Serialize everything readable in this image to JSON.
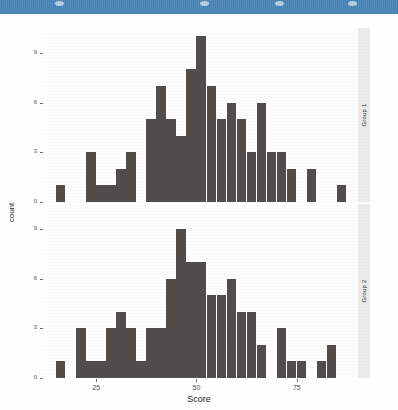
{
  "window": {
    "titlebar_color": "#4a86b8",
    "dots": [
      {
        "name": "chrome-dot-1",
        "x": 55
      },
      {
        "name": "chrome-dot-2",
        "x": 200
      },
      {
        "name": "chrome-dot-3",
        "x": 275
      },
      {
        "name": "chrome-dot-4",
        "x": 348
      }
    ]
  },
  "chart_data": {
    "type": "bar",
    "title": "",
    "subtitle": "",
    "xlabel": "Score",
    "ylabel": "count",
    "xlim": [
      12,
      90
    ],
    "ylim": [
      0,
      10.5
    ],
    "xticks": [
      25,
      50,
      75
    ],
    "yticks": [
      0,
      3,
      6,
      9
    ],
    "grid": false,
    "legend_position": "none",
    "bar_color": "#514d4a",
    "panel_background": "#fdfdfd",
    "strip_background": "#ebebeb",
    "facet_variable": "Group",
    "binwidth": 2.5,
    "panels": [
      {
        "strip_label": "Group 1",
        "bins": [
          {
            "x": 16.25,
            "count": 1
          },
          {
            "x": 18.75,
            "count": 0
          },
          {
            "x": 21.25,
            "count": 0
          },
          {
            "x": 23.75,
            "count": 3
          },
          {
            "x": 26.25,
            "count": 1
          },
          {
            "x": 28.75,
            "count": 1
          },
          {
            "x": 31.25,
            "count": 2
          },
          {
            "x": 33.75,
            "count": 3
          },
          {
            "x": 36.25,
            "count": 0
          },
          {
            "x": 38.75,
            "count": 5
          },
          {
            "x": 41.25,
            "count": 7
          },
          {
            "x": 43.75,
            "count": 5
          },
          {
            "x": 46.25,
            "count": 4
          },
          {
            "x": 48.75,
            "count": 8
          },
          {
            "x": 51.25,
            "count": 10
          },
          {
            "x": 53.75,
            "count": 7
          },
          {
            "x": 56.25,
            "count": 5
          },
          {
            "x": 58.75,
            "count": 6
          },
          {
            "x": 61.25,
            "count": 5
          },
          {
            "x": 63.75,
            "count": 3
          },
          {
            "x": 66.25,
            "count": 6
          },
          {
            "x": 68.75,
            "count": 3
          },
          {
            "x": 71.25,
            "count": 3
          },
          {
            "x": 73.75,
            "count": 2
          },
          {
            "x": 76.25,
            "count": 0
          },
          {
            "x": 78.75,
            "count": 2
          },
          {
            "x": 81.25,
            "count": 0
          },
          {
            "x": 83.75,
            "count": 0
          },
          {
            "x": 86.25,
            "count": 1
          }
        ]
      },
      {
        "strip_label": "Group 2",
        "bins": [
          {
            "x": 16.25,
            "count": 1
          },
          {
            "x": 18.75,
            "count": 0
          },
          {
            "x": 21.25,
            "count": 3
          },
          {
            "x": 23.75,
            "count": 1
          },
          {
            "x": 26.25,
            "count": 1
          },
          {
            "x": 28.75,
            "count": 3
          },
          {
            "x": 31.25,
            "count": 4
          },
          {
            "x": 33.75,
            "count": 3
          },
          {
            "x": 36.25,
            "count": 1
          },
          {
            "x": 38.75,
            "count": 3
          },
          {
            "x": 41.25,
            "count": 3
          },
          {
            "x": 43.75,
            "count": 6
          },
          {
            "x": 46.25,
            "count": 9
          },
          {
            "x": 48.75,
            "count": 7
          },
          {
            "x": 51.25,
            "count": 7
          },
          {
            "x": 53.75,
            "count": 5
          },
          {
            "x": 56.25,
            "count": 5
          },
          {
            "x": 58.75,
            "count": 6
          },
          {
            "x": 61.25,
            "count": 4
          },
          {
            "x": 63.75,
            "count": 4
          },
          {
            "x": 66.25,
            "count": 2
          },
          {
            "x": 68.75,
            "count": 0
          },
          {
            "x": 71.25,
            "count": 3
          },
          {
            "x": 73.75,
            "count": 1
          },
          {
            "x": 76.25,
            "count": 1
          },
          {
            "x": 78.75,
            "count": 0
          },
          {
            "x": 81.25,
            "count": 1
          },
          {
            "x": 83.75,
            "count": 2
          },
          {
            "x": 86.25,
            "count": 0
          }
        ]
      }
    ]
  }
}
